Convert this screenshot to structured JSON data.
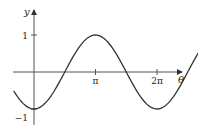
{
  "chart_data": {
    "type": "line",
    "title": "",
    "function": "y = -cos(theta)",
    "xlabel": "θ",
    "ylabel": "y",
    "xlim_pi": [
      -0.33,
      2.72
    ],
    "ylim": [
      -1.45,
      1.8
    ],
    "x_ticks": [
      {
        "value_pi": 1,
        "label": "π"
      },
      {
        "value_pi": 2,
        "label": "2π"
      }
    ],
    "y_ticks": [
      {
        "value": 1,
        "label": "1"
      },
      {
        "value": -1,
        "label": "−1"
      }
    ],
    "curve_domain_pi": [
      -0.33,
      2.72
    ],
    "series": [
      {
        "name": "-cos(θ)",
        "color": "#333333",
        "samples": 120
      }
    ],
    "grid": false,
    "legend": "none"
  }
}
